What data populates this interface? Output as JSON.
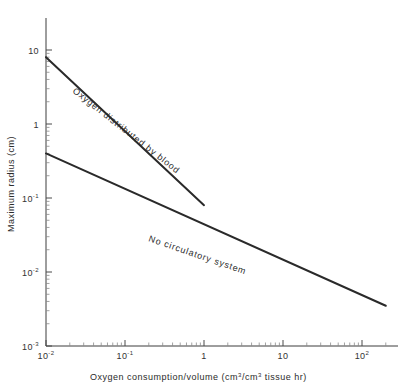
{
  "chart_data": {
    "type": "line",
    "title": "",
    "xlabel": "Oxygen consumption/volume (cm³/cm³ tissue hr)",
    "ylabel": "Maximum radius (cm)",
    "xscale": "log",
    "yscale": "log",
    "xlim": [
      0.01,
      300
    ],
    "ylim": [
      0.001,
      10
    ],
    "grid": false,
    "legend_position": "inline-along-curve",
    "x_tick_labels": [
      {
        "value": 0.01,
        "mantissa": "10",
        "exponent": "-2"
      },
      {
        "value": 0.1,
        "mantissa": "10",
        "exponent": "-1"
      },
      {
        "value": 1,
        "mantissa": "1",
        "exponent": ""
      },
      {
        "value": 10,
        "mantissa": "10",
        "exponent": ""
      },
      {
        "value": 100,
        "mantissa": "10",
        "exponent": "2"
      }
    ],
    "y_tick_labels": [
      {
        "value": 10,
        "mantissa": "10",
        "exponent": ""
      },
      {
        "value": 1,
        "mantissa": "1",
        "exponent": ""
      },
      {
        "value": 0.1,
        "mantissa": "10",
        "exponent": "-1"
      },
      {
        "value": 0.01,
        "mantissa": "10",
        "exponent": "-2"
      },
      {
        "value": 0.001,
        "mantissa": "10",
        "exponent": "-3"
      }
    ],
    "series": [
      {
        "name": "Oxygen distributed by blood",
        "label": "Oxygen distributed by blood",
        "x": [
          0.01,
          1.0
        ],
        "y": [
          8.0,
          0.08
        ],
        "slope": -0.5
      },
      {
        "name": "No circulatory system",
        "label": "No circulatory system",
        "x": [
          0.01,
          200.0
        ],
        "y": [
          0.4,
          0.0035
        ],
        "slope": -0.25
      }
    ]
  },
  "axes": {
    "x_title": "Oxygen consumption/volume (cm",
    "x_title_sup1": "3",
    "x_title_mid": "/cm",
    "x_title_sup2": "3",
    "x_title_end": " tissue hr)",
    "y_title": "Maximum radius (cm)"
  }
}
